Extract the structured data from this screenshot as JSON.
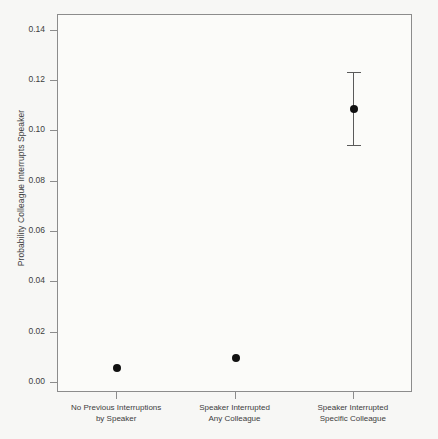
{
  "chart_data": {
    "type": "scatter",
    "title": "",
    "xlabel": "",
    "ylabel": "Probability Colleague Interrupts Speaker",
    "ylim": [
      -0.004,
      0.1463
    ],
    "yticks": [
      0.0,
      0.02,
      0.04,
      0.06,
      0.08,
      0.1,
      0.12,
      0.14
    ],
    "ytick_labels": [
      "0.00",
      "0.02",
      "0.04",
      "0.06",
      "0.08",
      "0.10",
      "0.12",
      "0.14"
    ],
    "grid": false,
    "legend": null,
    "categories": [
      "No Previous Interruptions\nby Speaker",
      "Speaker Interrupted\nAny Colleague",
      "Speaker Interrupted\nSpecific Colleague"
    ],
    "category_lines": [
      [
        "No Previous Interruptions",
        "by Speaker"
      ],
      [
        "Speaker Interrupted",
        "Any Colleague"
      ],
      [
        "Speaker Interrupted",
        "Specific Colleague"
      ]
    ],
    "values": [
      0.006,
      0.01,
      0.109
    ],
    "error_low": [
      null,
      null,
      0.0945
    ],
    "error_high": [
      null,
      null,
      0.1235
    ],
    "point_color": "#111111",
    "errorbar_color": "#5a5a5a",
    "axis_color": "#8c8c8c",
    "background_color": "#f7f7f5",
    "text_color": "#3d3d3d"
  },
  "axis": {
    "y_title": "Probability Colleague Interrupts Speaker"
  }
}
